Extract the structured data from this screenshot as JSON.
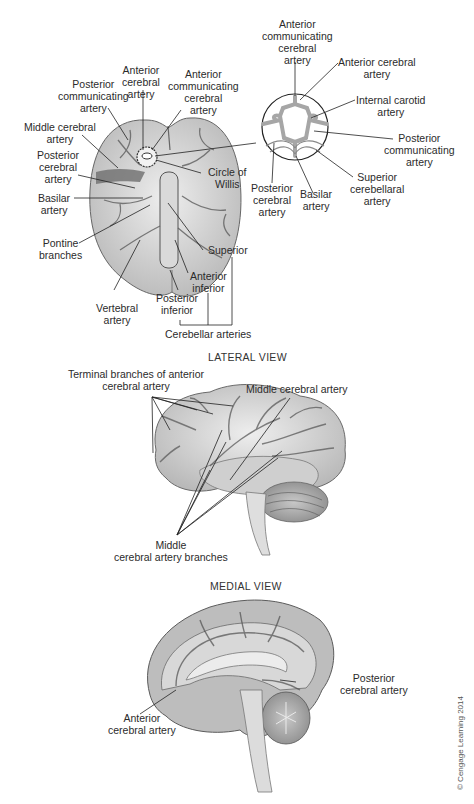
{
  "figure": {
    "copyright": "© Cengage Learning 2014",
    "inferior_view": {
      "labels": {
        "posterior_communicating": "Posterior\ncommunicating\nartery",
        "anterior_cerebral": "Anterior\ncerebral\nartery",
        "anterior_communicating": "Anterior\ncommunicating\ncerebral\nartery",
        "middle_cerebral": "Middle cerebral\nartery",
        "posterior_cerebral": "Posterior\ncerebral\nartery",
        "circle_of_willis": "Circle of\nWillis",
        "basilar": "Basilar\nartery",
        "pontine_branches": "Pontine\nbranches",
        "superior": "Superior",
        "anterior_inferior": "Anterior\ninferior",
        "posterior_inferior": "Posterior\ninferior",
        "vertebral": "Vertebral\nartery",
        "cerebellar_arteries": "Cerebellar arteries"
      }
    },
    "circle_inset": {
      "labels": {
        "anterior_communicating": "Anterior\ncommunicating\ncerebral\nartery",
        "anterior_cerebral": "Anterior cerebral\nartery",
        "internal_carotid": "Internal carotid\nartery",
        "posterior_communicating": "Posterior\ncommunicating\nartery",
        "superior_cerebellar": "Superior\ncerebellaral\nartery",
        "basilar": "Basilar\nartery",
        "posterior_cerebral": "Posterior\ncerebral\nartery"
      }
    },
    "lateral_view": {
      "title": "LATERAL VIEW",
      "labels": {
        "terminal_branches": "Terminal branches of anterior\ncerebral artery",
        "middle_cerebral": "Middle cerebral artery",
        "middle_branches": "Middle\ncerebral artery branches"
      }
    },
    "medial_view": {
      "title": "MEDIAL VIEW",
      "labels": {
        "posterior_cerebral": "Posterior\ncerebral artery",
        "anterior_cerebral": "Anterior\ncerebral artery"
      }
    }
  }
}
